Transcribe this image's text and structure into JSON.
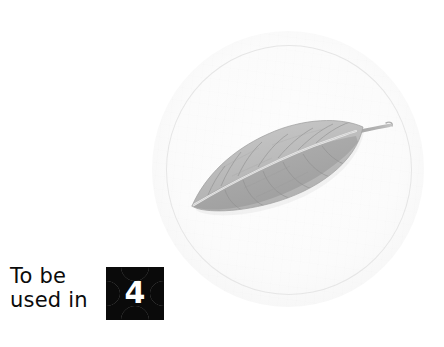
{
  "page": {
    "background_color": "#ffffff",
    "width": 444,
    "height": 347
  },
  "figure": {
    "plate": {
      "name": "circular-specimen-plate",
      "shape": "circle",
      "outer_fill": "#fbfbfb",
      "ring_stroke": "#e6e6e6",
      "center_x": 288,
      "center_y": 169,
      "outer_radius": 136,
      "ring_radius": 123
    },
    "specimen": {
      "name": "leaf",
      "kind": "leaf-illustration",
      "description": "Elliptic leaf with entire margin, acuminate apex at lower-left and short petiole at upper-right, showing midrib and pinnate secondary veins",
      "rendering": "grayscale",
      "blade_fill": "#b9b9b9",
      "blade_shadow": "#9a9a9a",
      "vein_color": "#8f8f8f",
      "midrib_color": "#e9e9e9",
      "petiole_color": "#a8a8a8",
      "apex_point": [
        192,
        206
      ],
      "petiole_tip": [
        391,
        125
      ]
    }
  },
  "caption": {
    "name": "figure-caption",
    "lines": [
      "To be",
      "used in"
    ],
    "color": "#0b0b0b"
  },
  "badge": {
    "name": "reference-number-badge",
    "number": "4",
    "shape": "concave-cornered-square",
    "fill_color": "#0a0a0a",
    "plate_color": "#8d8d8d",
    "number_color": "#ffffff"
  }
}
